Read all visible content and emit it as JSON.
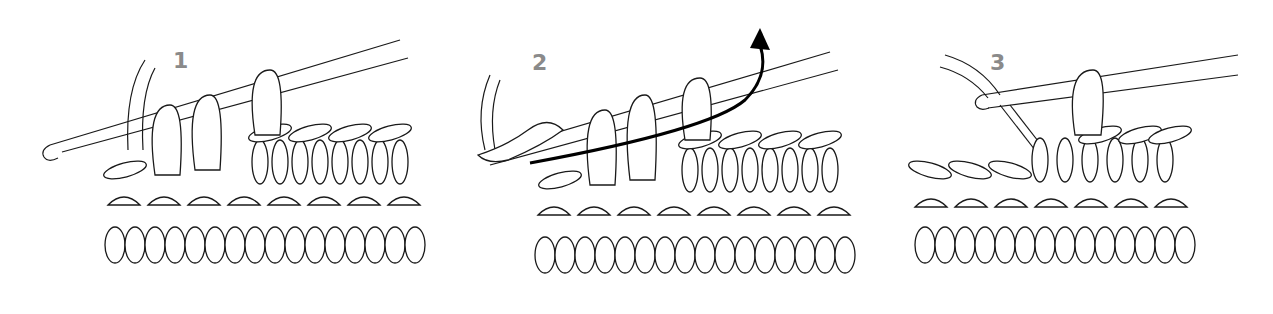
{
  "figure": {
    "colors": {
      "background": "#ffffff",
      "outline": "#1a1a1a",
      "step_label": "#8a8a8a",
      "arrow": "#000000"
    },
    "steps": [
      {
        "number": "1",
        "icon": "crochet-hook-with-loops"
      },
      {
        "number": "2",
        "icon": "yarn-over-pull-through-arrow"
      },
      {
        "number": "3",
        "icon": "crochet-hook-single-loop"
      }
    ]
  }
}
